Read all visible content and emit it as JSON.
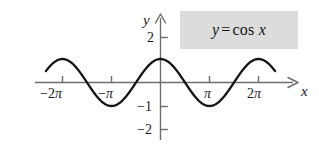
{
  "figure": {
    "title": "",
    "background_color": "#ffffff",
    "curve_color": "#141414",
    "axis_color": "#6e6e6e",
    "label_box_color": "#dcdcdc",
    "equation_label": {
      "lhs": "y",
      "operator": "=",
      "function": "cos",
      "argument": "x"
    },
    "axis_names": {
      "x": "x",
      "y": "y"
    },
    "x_tick_labels": [
      {
        "text": "−2π",
        "sign": "−",
        "coefficient": "2",
        "symbol": "π",
        "value": -6.2832
      },
      {
        "text": "−π",
        "sign": "−",
        "coefficient": "",
        "symbol": "π",
        "value": -3.1416
      },
      {
        "text": "π",
        "sign": "",
        "coefficient": "",
        "symbol": "π",
        "value": 3.1416
      },
      {
        "text": "2π",
        "sign": "",
        "coefficient": "2",
        "symbol": "π",
        "value": 6.2832
      }
    ],
    "y_tick_labels": [
      {
        "text": "2",
        "value": 2
      },
      {
        "text": "−1",
        "value": -1
      },
      {
        "text": "−2",
        "value": -2
      }
    ]
  },
  "chart_data": {
    "type": "line",
    "xlabel": "x",
    "ylabel": "y",
    "grid": false,
    "legend": "none",
    "annotations": [
      "y = cos x"
    ],
    "xlim": [
      -7.2,
      7.2
    ],
    "ylim": [
      -2.6,
      2.6
    ],
    "xticks": [
      -6.2832,
      -3.1416,
      3.1416,
      6.2832
    ],
    "xticklabels": [
      "−2π",
      "−π",
      "π",
      "2π"
    ],
    "yticks": [
      2,
      -1,
      -2
    ],
    "yticklabels": [
      "2",
      "−1",
      "−2"
    ],
    "series": [
      {
        "name": "y = cos x",
        "expression": "cos(x)",
        "x": [
          -7.069,
          -6.676,
          -6.283,
          -5.89,
          -5.498,
          -5.105,
          -4.712,
          -4.32,
          -3.927,
          -3.534,
          -3.142,
          -2.749,
          -2.356,
          -1.963,
          -1.571,
          -1.178,
          -0.785,
          -0.393,
          0.0,
          0.393,
          0.785,
          1.178,
          1.571,
          1.963,
          2.356,
          2.749,
          3.142,
          3.534,
          3.927,
          4.32,
          4.712,
          5.105,
          5.498,
          5.89,
          6.283,
          6.676,
          7.069
        ],
        "y": [
          0.707,
          0.924,
          1.0,
          0.924,
          0.707,
          0.383,
          0.0,
          -0.383,
          -0.707,
          -0.924,
          -1.0,
          -0.924,
          -0.707,
          -0.383,
          0.0,
          0.383,
          0.707,
          0.924,
          1.0,
          0.924,
          0.707,
          0.383,
          0.0,
          -0.383,
          -0.707,
          -0.924,
          -1.0,
          -0.924,
          -0.707,
          -0.383,
          0.0,
          0.383,
          0.707,
          0.924,
          1.0,
          0.924,
          0.707
        ]
      }
    ]
  }
}
